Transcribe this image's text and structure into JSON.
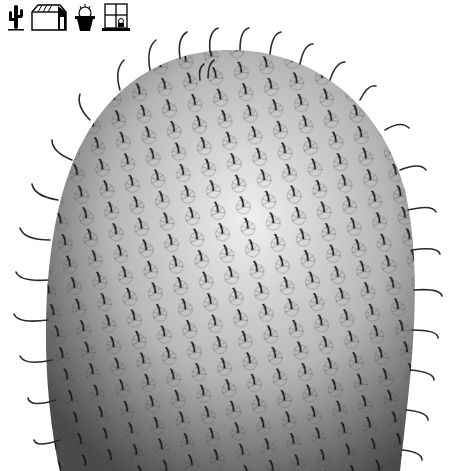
{
  "nav": {
    "items": [
      {
        "name": "cactus-icon",
        "label": ""
      },
      {
        "name": "greenhouse-icon",
        "label": ""
      },
      {
        "name": "potted-cactus-icon",
        "label": ""
      },
      {
        "name": "window-plant-icon",
        "label": ""
      }
    ]
  },
  "hero": {
    "subject": "cactus-photo",
    "colors": {
      "spine": "#2a2a2a",
      "body_light": "#e6e6e6",
      "body_dark": "#5a5a5a",
      "background": "#ffffff"
    }
  }
}
